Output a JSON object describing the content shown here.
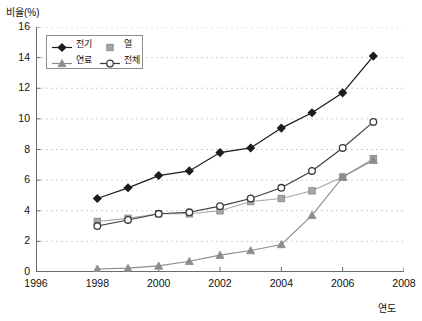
{
  "axis": {
    "ylabel": "비율(%)",
    "xlabel": "연도",
    "yticks": [
      "0",
      "2",
      "4",
      "6",
      "8",
      "10",
      "12",
      "14",
      "16"
    ],
    "xticks": [
      "1996",
      "1998",
      "2000",
      "2002",
      "2004",
      "2006",
      "2008"
    ]
  },
  "legend": {
    "items": [
      {
        "label": "전기",
        "marker": "filled-diamond-marker",
        "color": "#1c1c1c"
      },
      {
        "label": "열",
        "marker": "filled-square-marker",
        "color": "#a6a6a6"
      },
      {
        "label": "연료",
        "marker": "filled-triangle-marker",
        "color": "#8c8c8c"
      },
      {
        "label": "전체",
        "marker": "open-circle-marker",
        "color": "#3a3a3a"
      }
    ]
  },
  "chart_data": {
    "type": "line",
    "title": "",
    "xlabel": "연도",
    "ylabel": "비율(%)",
    "xlim": [
      1996,
      2008
    ],
    "ylim": [
      0,
      16
    ],
    "xticks": [
      1996,
      1998,
      2000,
      2002,
      2004,
      2006,
      2008
    ],
    "yticks": [
      0,
      2,
      4,
      6,
      8,
      10,
      12,
      14,
      16
    ],
    "grid": "horizontal-dashed",
    "legend_position": "top-left-inside",
    "x": [
      1998,
      1999,
      2000,
      2001,
      2002,
      2003,
      2004,
      2005,
      2006,
      2007
    ],
    "series": [
      {
        "name": "전기",
        "marker": "filled-diamond-marker",
        "color": "#1c1c1c",
        "values": [
          4.8,
          5.5,
          6.3,
          6.6,
          7.8,
          8.1,
          9.4,
          10.4,
          11.7,
          14.1
        ]
      },
      {
        "name": "열",
        "marker": "filled-square-marker",
        "color": "#a6a6a6",
        "values": [
          3.3,
          3.5,
          3.8,
          3.8,
          4.0,
          4.6,
          4.8,
          5.3,
          6.2,
          7.4
        ]
      },
      {
        "name": "연료",
        "marker": "filled-triangle-marker",
        "color": "#8c8c8c",
        "values": [
          0.2,
          0.25,
          0.4,
          0.7,
          1.1,
          1.4,
          1.8,
          3.7,
          6.2,
          7.3
        ]
      },
      {
        "name": "전체",
        "marker": "open-circle-marker",
        "color": "#3a3a3a",
        "values": [
          3.0,
          3.4,
          3.8,
          3.9,
          4.3,
          4.8,
          5.5,
          6.6,
          8.1,
          9.8
        ]
      }
    ]
  }
}
